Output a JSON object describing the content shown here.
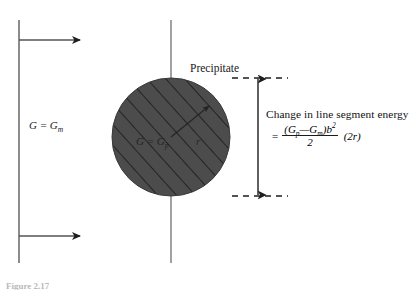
{
  "figure": {
    "type": "materials-science-schematic",
    "background_color": "#ffffff",
    "line_color": "#6e6e6e",
    "ink_color": "#1a1a1a",
    "precipitate_fill": "#4c4c4c",
    "hatch_color": "#2b2b2b",
    "labels": {
      "matrix_modulus": "G = Gₘ",
      "matrix_modulus_base": "G = G",
      "matrix_modulus_sub": "m",
      "precipitate": "Precipitate",
      "precipitate_modulus_base": "G = G",
      "precipitate_modulus_sub": "p",
      "radius": "r"
    },
    "annotation": {
      "title": "Change in line segment energy",
      "equals": "=",
      "numerator_open": "(G",
      "numerator_sub_p": "p",
      "numerator_minus": "—G",
      "numerator_sub_m": "m",
      "numerator_close": ")b",
      "numerator_exp": "2",
      "denominator": "2",
      "tail": "(2r)"
    },
    "caption": "Figure 2.17",
    "geometry": {
      "left_axis_x": 19,
      "left_axis_y_top": 20,
      "left_axis_y_bottom": 263,
      "center_axis_x": 171,
      "center_axis_y_top": 20,
      "center_axis_y_bottom": 263,
      "arrow_top_y": 40,
      "arrow_bottom_y": 236,
      "arrow_tip_x": 84,
      "circle_cx": 171,
      "circle_cy": 137,
      "circle_r": 59,
      "dim_arrow_x": 258,
      "dashed_top_y": 78,
      "dashed_bottom_y": 196,
      "dashed_x_start": 232,
      "dashed_x_end": 286
    }
  }
}
